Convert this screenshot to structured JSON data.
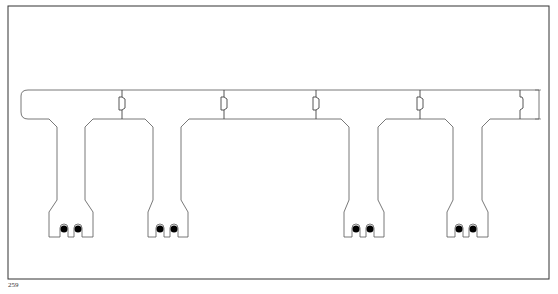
{
  "page": {
    "number": "259"
  },
  "figure": {
    "beam_count": 4,
    "strands_per_beam": 2,
    "colors": {
      "line": "#555555",
      "frame": "#333333",
      "strand": "#000000",
      "background": "#ffffff"
    }
  }
}
